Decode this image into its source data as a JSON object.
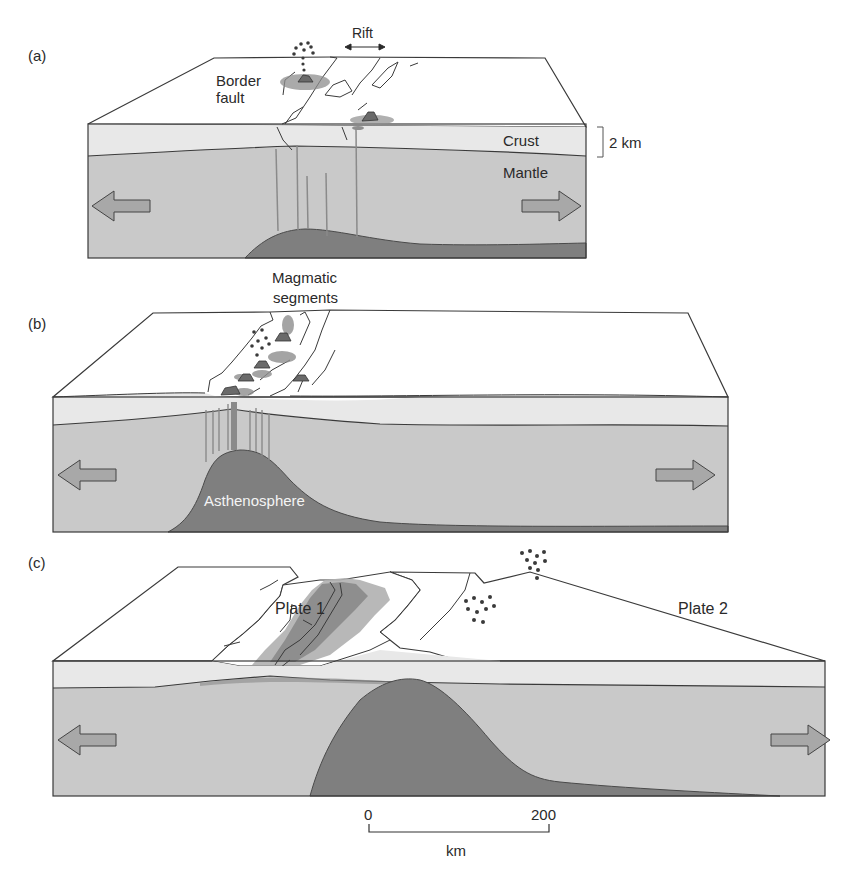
{
  "figure": {
    "panels": [
      {
        "id": "a",
        "label": "(a)",
        "annotations": {
          "rift": "Rift",
          "border_fault_line1": "Border",
          "border_fault_line2": "fault",
          "crust": "Crust",
          "mantle": "Mantle",
          "thickness": "2 km"
        }
      },
      {
        "id": "b",
        "label": "(b)",
        "annotations": {
          "magmatic_line1": "Magmatic",
          "magmatic_line2": "segments",
          "asthenosphere": "Asthenosphere"
        }
      },
      {
        "id": "c",
        "label": "(c)",
        "annotations": {
          "plate1": "Plate 1",
          "plate2": "Plate 2"
        }
      }
    ],
    "scale_bar": {
      "start": "0",
      "end": "200",
      "unit": "km"
    },
    "colors": {
      "top_surface": "#ffffff",
      "crust": "#e8e8e8",
      "mantle": "#c9c9c9",
      "asthenosphere": "#7f7f7f",
      "magma": "#8a8a8a",
      "magma_light": "#b0b0b0",
      "outline": "#3a3a3a",
      "arrow_fill": "#a8a8a8"
    }
  }
}
